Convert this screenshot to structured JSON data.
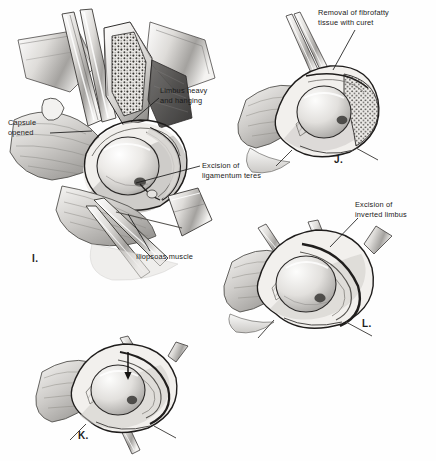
{
  "figure": {
    "background_color": "#fefefe",
    "ink_color": "#1a1a1a",
    "width": 436,
    "height": 461
  },
  "annotations": [
    {
      "id": "capsule-opened",
      "text": "Capsule\nopened",
      "x": 8,
      "y": 118,
      "align": "left",
      "leader": {
        "x1": 50,
        "y1": 133,
        "x2": 92,
        "y2": 131
      }
    },
    {
      "id": "limbus-heavy-and-hanging",
      "text": "Limbus heavy\nand hanging",
      "x": 160,
      "y": 86,
      "align": "left",
      "leader": {
        "x1": 159,
        "y1": 98,
        "x2": 131,
        "y2": 122
      }
    },
    {
      "id": "excision-of-ligamentum-teres",
      "text": "Excision of\nligamentum teres",
      "x": 202,
      "y": 161,
      "align": "left",
      "leader": {
        "x1": 200,
        "y1": 166,
        "x2": 136,
        "y2": 183
      }
    },
    {
      "id": "iliopsoas-muscle",
      "text": "Iliopsoas muscle",
      "x": 136,
      "y": 252,
      "align": "left",
      "leader": {
        "x1": 150,
        "y1": 251,
        "x2": 128,
        "y2": 214
      }
    },
    {
      "id": "removal-of-fibrofatty-tissue-with-curet",
      "text": "Removal of fibrofatty\ntissue with curet",
      "x": 318,
      "y": 8,
      "align": "left",
      "leader": {
        "x1": 355,
        "y1": 30,
        "x2": 333,
        "y2": 70
      }
    },
    {
      "id": "excision-of-inverted-limbus",
      "text": "Excision of\ninverted limbus",
      "x": 355,
      "y": 200,
      "align": "left",
      "leader": {
        "x1": 358,
        "y1": 218,
        "x2": 330,
        "y2": 247
      }
    }
  ],
  "panels": [
    {
      "id": "panel-i",
      "letter": "I.",
      "x": 32,
      "y": 253,
      "subject": "hip joint exposed, capsule opened, limbus hanging, ligamentum teres excised, iliopsoas muscle"
    },
    {
      "id": "panel-j",
      "letter": "J.",
      "x": 334,
      "y": 154,
      "subject": "acetabulum cleared of fibrofatty tissue with curet"
    },
    {
      "id": "panel-l",
      "letter": "L.",
      "x": 362,
      "y": 318,
      "subject": "inverted limbus excised, femoral head seated"
    },
    {
      "id": "panel-k",
      "letter": "K.",
      "x": 78,
      "y": 430,
      "subject": "femoral head reduced into acetabulum, arrow indicates direction"
    }
  ],
  "palette": {
    "ink": "#1a1a1a",
    "bone_light": "#f2f1ef",
    "bone_mid": "#d8d6d3",
    "bone_shadow": "#9d9b98",
    "deep_shadow": "#4a4846",
    "marrow_dark": "#2e2c2b",
    "tissue_tone": "#bcbab7",
    "paper": "#fefefe"
  }
}
